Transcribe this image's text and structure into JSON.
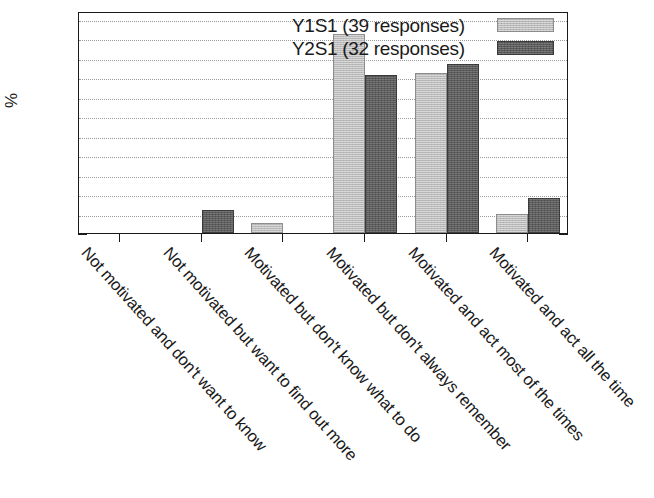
{
  "chart_data": {
    "type": "bar",
    "title": "",
    "subtitle": "",
    "xlabel": "",
    "ylabel": "%",
    "ylim": [
      0,
      57
    ],
    "yticks": [
      0,
      10,
      20,
      30,
      40,
      50
    ],
    "ytick_labels": [
      "0",
      "10",
      "20",
      "30",
      "40",
      "50"
    ],
    "minor_gridlines": [
      5,
      15,
      25,
      35,
      45,
      55
    ],
    "grid": true,
    "grid_style": "dotted",
    "legend_position": "top-right",
    "orientation": "vertical",
    "grouping": "clustered",
    "categories": [
      "Not motivated and don't want to know",
      "Not motivated but want to find out more",
      "Motivated but don't know what to do",
      "Motivated but don't always remember",
      "Motivated and act most of the times",
      "Motivated and act all the time"
    ],
    "series": [
      {
        "name": "Y1S1 (39 responses)",
        "short_name": "Y1S1",
        "responses": 39,
        "color": "#b9b9b9",
        "values": [
          0,
          0,
          2.5,
          51,
          41,
          5
        ]
      },
      {
        "name": "Y2S1 (32 responses)",
        "short_name": "Y2S1",
        "responses": 32,
        "color": "#5c5c5c",
        "values": [
          0,
          6,
          0,
          40.5,
          43.5,
          9
        ]
      }
    ]
  },
  "legend": {
    "entries": [
      {
        "label": "Y1S1 (39 responses)",
        "swatch": "light-gray"
      },
      {
        "label": "Y2S1 (32 responses)",
        "swatch": "dark-gray"
      }
    ]
  },
  "axes": {
    "y_axis_title": "%",
    "y_tick_labels": [
      "0",
      "10",
      "20",
      "30",
      "40",
      "50"
    ],
    "x_tick_labels": [
      "Not motivated and don't want to know",
      "Not motivated but want to find out more",
      "Motivated but don't know what to do",
      "Motivated but don't always remember",
      "Motivated and act most of the times",
      "Motivated and act all the time"
    ]
  }
}
